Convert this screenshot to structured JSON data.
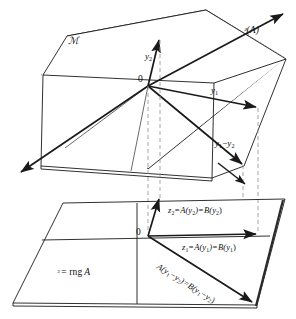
{
  "figure": {
    "type": "mathematical-diagram",
    "background_color": "#ffffff",
    "line_color": "#1a1a1a",
    "dashed_color": "#999999",
    "width": 296,
    "height": 319
  },
  "top_plane": {
    "name": "domain-plane",
    "label": "ℳ",
    "label_plain": "M",
    "origin_label": "0",
    "vectors": [
      {
        "name": "y2",
        "label_main": "y",
        "label_sub": "2"
      },
      {
        "name": "y1",
        "label_main": "y",
        "label_sub": "1"
      },
      {
        "name": "y1-minus-y2",
        "label_main": "y",
        "label_sub": "1",
        "label_op": "−",
        "label_main2": "y",
        "label_sub2": "2"
      },
      {
        "name": "null-space-ray",
        "label": "ᵊ(A)",
        "label_script": "N",
        "label_paren": "(A)"
      }
    ]
  },
  "bottom_plane": {
    "name": "range-plane",
    "label_script": "W",
    "label_rest": "= rng A",
    "origin_label": "0",
    "vectors": [
      {
        "name": "z2",
        "parts": [
          "z",
          "2",
          " = A(y",
          "2",
          ") = B(y",
          "2",
          ")"
        ],
        "text": "z₂ = A(y₂) = B(y₂)"
      },
      {
        "name": "z1",
        "parts": [
          "z",
          "1",
          " = A(y",
          "1",
          ") = B(y",
          "1",
          ")"
        ],
        "text": "z₁ = A(y₁) = B(y₁)"
      },
      {
        "name": "a-y1-minus-y2",
        "text": "A(y₁−y₂) = B(y₁−y₂)"
      }
    ]
  },
  "labels": {
    "top_plane_name": "ℳ",
    "null_space": "ᵊ(A)",
    "y2": "y",
    "y2_sub": "2",
    "y1": "y",
    "y1_sub": "1",
    "y1_minus_y2_a": "y",
    "y1_minus_y2_a_sub": "1",
    "y1_minus_y2_op": "−",
    "y1_minus_y2_b": "y",
    "y1_minus_y2_b_sub": "2",
    "origin_top": "0",
    "origin_bottom": "0",
    "range_w": "ᵌ",
    "range_eq": "= rng",
    "range_a": "A",
    "z2_z": "z",
    "z2_sub1": "2",
    "z2_mid": "=A(y",
    "z2_sub2": "2",
    "z2_mid2": ")=B(y",
    "z2_sub3": "2",
    "z2_end": ")",
    "z1_z": "z",
    "z1_sub1": "1",
    "z1_mid": "=A(y",
    "z1_sub2": "1",
    "z1_mid2": ")=B(y",
    "z1_sub3": "1",
    "z1_end": ")",
    "diag_a": "A(y",
    "diag_sub1": "1",
    "diag_op": "−y",
    "diag_sub2": "2",
    "diag_mid": ")=B(y",
    "diag_sub3": "1",
    "diag_op2": "−y",
    "diag_sub4": "2",
    "diag_end": ")"
  },
  "colors": {
    "stroke": "#1a1a1a",
    "dashed": "#9a9a9a",
    "fill": "#ffffff",
    "thick_edge": "#2a2a2a"
  }
}
